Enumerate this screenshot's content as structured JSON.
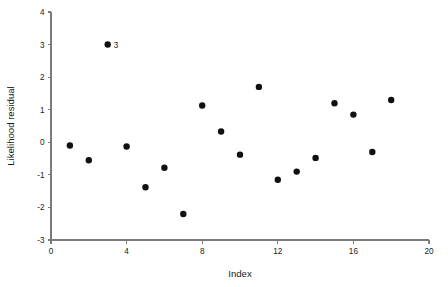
{
  "chart_data": {
    "type": "scatter",
    "title": "",
    "xlabel": "Index",
    "ylabel": "Likelihood residual",
    "xlim": [
      0,
      20
    ],
    "ylim": [
      -3,
      4
    ],
    "grid": false,
    "legend": null,
    "xticks": [
      0,
      4,
      8,
      12,
      16,
      20
    ],
    "xticklabels": [
      "0",
      "4",
      "8",
      "12",
      "16",
      "20"
    ],
    "yticks": [
      -3,
      -2,
      -1,
      0,
      1,
      2,
      3,
      4
    ],
    "yticklabels": [
      "-3",
      "-2",
      "-1",
      "0",
      "1",
      "2",
      "3",
      "4"
    ],
    "x": [
      1,
      2,
      3,
      4,
      5,
      6,
      7,
      8,
      9,
      10,
      11,
      12,
      13,
      14,
      15,
      16,
      17,
      18
    ],
    "y": [
      -0.1,
      -0.55,
      3.0,
      -0.13,
      -1.38,
      -0.78,
      -2.2,
      1.13,
      0.33,
      -0.38,
      1.7,
      -1.15,
      -0.9,
      -0.48,
      1.2,
      0.85,
      -0.3,
      1.3
    ],
    "marker": "filled-circle",
    "marker_color": "#101010",
    "marker_size": 3.2,
    "annotations": [
      {
        "label": "3",
        "x": 3,
        "y": 3.0
      }
    ]
  },
  "axes": {
    "x_title": "Index",
    "y_title": "Likelihood residual"
  }
}
